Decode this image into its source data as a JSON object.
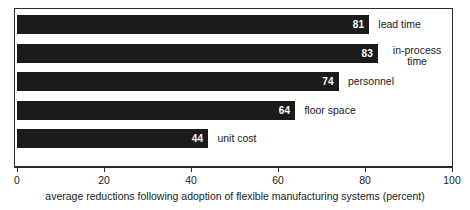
{
  "chart_data": {
    "type": "bar",
    "orientation": "horizontal",
    "categories": [
      "lead time",
      "in-process time",
      "personnel",
      "floor space",
      "unit cost"
    ],
    "values": [
      81,
      83,
      74,
      64,
      44
    ],
    "data_labels": [
      "81",
      "83",
      "74",
      "64",
      "44"
    ],
    "title": "",
    "subtitle": "",
    "xlabel": "average reductions following adoption of flexible manufacturing systems (percent)",
    "ylabel": "",
    "xlim": [
      0,
      100
    ],
    "xticks": [
      0,
      20,
      40,
      60,
      80,
      100
    ],
    "xtick_labels": [
      "0",
      "20",
      "40",
      "60",
      "80",
      "100"
    ],
    "grid": false,
    "legend": false,
    "legend_position": "none",
    "bar_color": "#1b1b1b",
    "value_label_color": "#ffffff",
    "frame_color": "#2b2b2b",
    "background": "#ffffff"
  },
  "caption": {
    "text": "average reductions following adoption of flexible manufacturing systems (percent)"
  },
  "bars": [
    {
      "label": "lead time",
      "label_lines": "lead time",
      "value": 81,
      "value_text": "81",
      "two_line": false
    },
    {
      "label": "in-process time",
      "label_lines": "in-process\ntime",
      "value": 83,
      "value_text": "83",
      "two_line": true
    },
    {
      "label": "personnel",
      "label_lines": "personnel",
      "value": 74,
      "value_text": "74",
      "two_line": false
    },
    {
      "label": "floor space",
      "label_lines": "floor space",
      "value": 64,
      "value_text": "64",
      "two_line": false
    },
    {
      "label": "unit cost",
      "label_lines": "unit cost",
      "value": 44,
      "value_text": "44",
      "two_line": false
    }
  ],
  "axis": {
    "ticks": [
      {
        "value": 0,
        "label": "0"
      },
      {
        "value": 20,
        "label": "20"
      },
      {
        "value": 40,
        "label": "40"
      },
      {
        "value": 60,
        "label": "60"
      },
      {
        "value": 80,
        "label": "80"
      },
      {
        "value": 100,
        "label": "100"
      }
    ]
  }
}
